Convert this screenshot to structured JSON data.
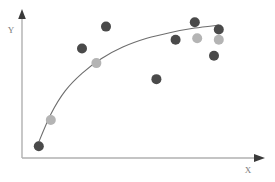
{
  "figure": {
    "background_color": "#ffffff",
    "width": 275,
    "height": 182
  },
  "axes": {
    "x_label": "X",
    "y_label": "Y",
    "axis_color": "#b0b0b0",
    "arrow_color": "#3a3a3a",
    "label_color": "#7a7a7a",
    "origin_px": {
      "x": 22,
      "y": 158
    },
    "x_end_px": 262,
    "y_top_px": 12
  },
  "series_colors": {
    "dark": "#4a4a4a",
    "light": "#b4b4b4",
    "curve": "#6e6e6e"
  },
  "chart_data": {
    "type": "scatter",
    "title": "",
    "subtitle": "",
    "xlabel": "X",
    "ylabel": "Y",
    "xlim": [
      0,
      100
    ],
    "ylim": [
      0,
      100
    ],
    "grid": false,
    "legend": false,
    "legend_position": "none",
    "annotations": [],
    "tick_labels": {
      "x": [],
      "y": []
    },
    "marker_radius": 5,
    "series": [
      {
        "name": "dark points",
        "color": "#4a4a4a",
        "points": [
          {
            "x": 7,
            "y": 8
          },
          {
            "x": 25,
            "y": 75
          },
          {
            "x": 35,
            "y": 90
          },
          {
            "x": 56,
            "y": 54
          },
          {
            "x": 64,
            "y": 81
          },
          {
            "x": 80,
            "y": 70
          },
          {
            "x": 72,
            "y": 93
          },
          {
            "x": 82,
            "y": 88
          }
        ]
      },
      {
        "name": "light points",
        "color": "#b4b4b4",
        "points": [
          {
            "x": 12,
            "y": 26
          },
          {
            "x": 31,
            "y": 65
          },
          {
            "x": 73,
            "y": 82
          },
          {
            "x": 82,
            "y": 81
          }
        ]
      }
    ],
    "fit_curve": {
      "name": "trend line",
      "color": "#6e6e6e",
      "shape": "logarithmic",
      "points": [
        {
          "x": 6,
          "y": 7
        },
        {
          "x": 12,
          "y": 30
        },
        {
          "x": 18,
          "y": 46
        },
        {
          "x": 25,
          "y": 58
        },
        {
          "x": 33,
          "y": 68
        },
        {
          "x": 42,
          "y": 76
        },
        {
          "x": 52,
          "y": 82
        },
        {
          "x": 62,
          "y": 86
        },
        {
          "x": 72,
          "y": 89
        },
        {
          "x": 82,
          "y": 91
        }
      ]
    }
  }
}
